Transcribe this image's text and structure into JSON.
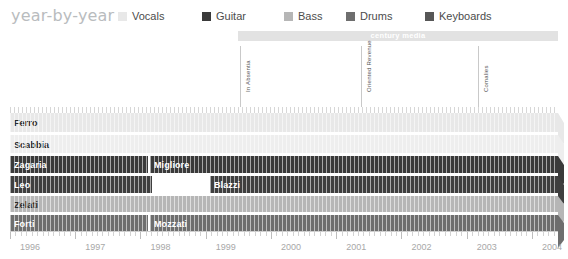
{
  "header": {
    "title": "year-by-year",
    "legend": [
      {
        "label": "Vocals",
        "color": "#e8e8e8",
        "x": 0
      },
      {
        "label": "Guitar",
        "color": "#3a3a3a",
        "x": 84
      },
      {
        "label": "Bass",
        "color": "#b6b6b6",
        "x": 166
      },
      {
        "label": "Drums",
        "color": "#6e6e6e",
        "x": 228
      },
      {
        "label": "Keyboards",
        "color": "#575757",
        "x": 307
      }
    ]
  },
  "label_band": {
    "text": "century media",
    "color": "#e2e2e2",
    "text_color": "#ffffff"
  },
  "albums": [
    {
      "name": "In Absentia",
      "x": 240
    },
    {
      "name": "Oriented Revenue",
      "x": 361
    },
    {
      "name": "Comalies",
      "x": 478
    }
  ],
  "chart_data": {
    "type": "bar",
    "title": "year-by-year",
    "xlabel": "",
    "ylabel": "",
    "xlim": [
      1996,
      2004.4
    ],
    "grid": true,
    "legend_position": "top",
    "categories": [
      "Vocals",
      "Guitar",
      "Bass",
      "Drums",
      "Keyboards"
    ],
    "x_ticks": [
      "1996",
      "1997",
      "1998",
      "1999",
      "2000",
      "2001",
      "2002",
      "2003",
      "2004"
    ],
    "rows": [
      {
        "role": "Vocals",
        "color": "#e8e8e8",
        "top": 0,
        "height": 20,
        "segments": [
          {
            "name": "Ferro",
            "start": 0,
            "end": 548,
            "color": "#e8e8e8",
            "tone": "light",
            "arrow": true
          }
        ]
      },
      {
        "role": "Vocals",
        "color": "#eeeeee",
        "top": 22,
        "height": 19,
        "segments": [
          {
            "name": "Scabbia",
            "start": 0,
            "end": 548,
            "color": "#eeeeee",
            "tone": "light",
            "arrow": true
          }
        ]
      },
      {
        "role": "Guitar",
        "color": "#3a3a3a",
        "top": 43,
        "height": 18,
        "segments": [
          {
            "name": "Zagaria",
            "start": 0,
            "end": 138,
            "color": "#3a3a3a",
            "tone": "dark",
            "arrow": false
          },
          {
            "name": "Migliore",
            "start": 140,
            "end": 548,
            "color": "#3a3a3a",
            "tone": "dark",
            "arrow": true
          }
        ]
      },
      {
        "role": "Guitar",
        "color": "#3f3f3f",
        "top": 63,
        "height": 18,
        "segments": [
          {
            "name": "Leo",
            "start": 0,
            "end": 142,
            "color": "#3f3f3f",
            "tone": "dark",
            "arrow": false
          },
          {
            "name": "Blazzi",
            "start": 200,
            "end": 548,
            "color": "#3f3f3f",
            "tone": "dark",
            "arrow": true
          }
        ]
      },
      {
        "role": "Bass",
        "color": "#b6b6b6",
        "top": 83,
        "height": 17,
        "segments": [
          {
            "name": "Zelati",
            "start": 0,
            "end": 548,
            "color": "#b6b6b6",
            "tone": "light",
            "arrow": true
          }
        ]
      },
      {
        "role": "Drums",
        "color": "#6e6e6e",
        "top": 102,
        "height": 17,
        "segments": [
          {
            "name": "Forti",
            "start": 0,
            "end": 138,
            "color": "#6e6e6e",
            "tone": "dark",
            "arrow": false
          },
          {
            "name": "Mozzati",
            "start": 140,
            "end": 548,
            "color": "#6e6e6e",
            "tone": "dark",
            "arrow": true
          }
        ]
      }
    ]
  }
}
